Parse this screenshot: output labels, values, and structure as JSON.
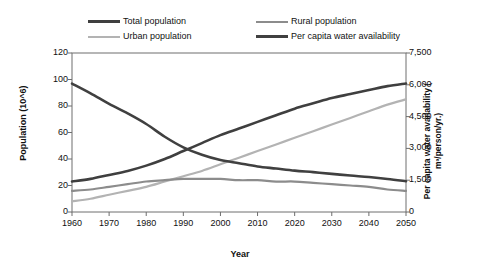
{
  "chart_data": {
    "type": "line",
    "title": "",
    "xlabel": "Year",
    "ylabel": "Population (10^6)",
    "y2label": "Per capita water availability ( m³/person/yr.)",
    "x": [
      1960,
      1965,
      1970,
      1975,
      1980,
      1985,
      1990,
      1995,
      2000,
      2005,
      2010,
      2015,
      2020,
      2025,
      2030,
      2035,
      2040,
      2045,
      2050
    ],
    "xlim": [
      1960,
      2050
    ],
    "xticks": [
      "1960",
      "1970",
      "1980",
      "1990",
      "2000",
      "2010",
      "2020",
      "2030",
      "2040",
      "2050"
    ],
    "ylim": [
      0,
      120
    ],
    "yticks": [
      "0",
      "20",
      "40",
      "60",
      "80",
      "100",
      "120"
    ],
    "y2lim": [
      0,
      7500
    ],
    "y2ticks": [
      "0",
      "1,500",
      "3,000",
      "4,500",
      "6,000",
      "7,500"
    ],
    "grid": false,
    "legend_position": "top",
    "series": [
      {
        "name": "Total population",
        "axis": "left",
        "color": "#3f3f3f",
        "width": 2.6,
        "values": [
          23,
          25,
          28,
          31,
          35,
          40,
          46,
          52,
          58,
          63,
          68,
          73,
          78,
          82,
          86,
          89,
          92,
          95,
          97
        ]
      },
      {
        "name": "Urban population",
        "axis": "left",
        "color": "#b3b3b3",
        "width": 2.2,
        "values": [
          8,
          10,
          13,
          16,
          19,
          23,
          27,
          31,
          36,
          41,
          46,
          51,
          56,
          61,
          66,
          71,
          76,
          81,
          85
        ]
      },
      {
        "name": "Rural population",
        "axis": "left",
        "color": "#8c8c8c",
        "width": 2.2,
        "values": [
          16,
          17,
          19,
          21,
          23,
          24,
          25,
          25,
          25,
          24,
          24,
          23,
          23,
          22,
          21,
          20,
          19,
          17,
          16
        ]
      },
      {
        "name": "Per capita water availability",
        "axis": "right",
        "color": "#404040",
        "width": 2.6,
        "values": [
          6060,
          5600,
          5100,
          4650,
          4150,
          3550,
          3050,
          2700,
          2450,
          2300,
          2150,
          2050,
          1950,
          1880,
          1800,
          1720,
          1650,
          1560,
          1450
        ]
      }
    ],
    "annotations": []
  },
  "legend": {
    "items": [
      {
        "label": "Total population",
        "swatch": "sw-total"
      },
      {
        "label": "Rural population",
        "swatch": "sw-rural"
      },
      {
        "label": "Urban population",
        "swatch": "sw-urban"
      },
      {
        "label": "Per capita water availability",
        "swatch": "sw-water"
      }
    ]
  }
}
